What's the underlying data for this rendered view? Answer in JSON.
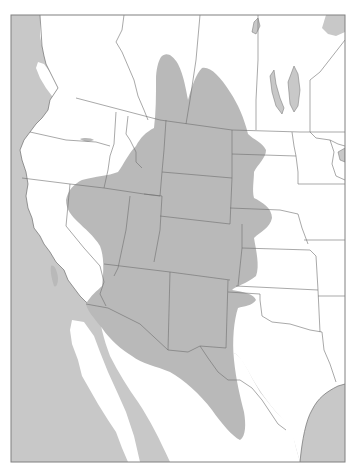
{
  "map": {
    "type": "species-range-map",
    "region": "Western North America",
    "frame": {
      "x": 11,
      "y": 15,
      "width": 334,
      "height": 447
    },
    "colors": {
      "water": "#c8c8c8",
      "land": "#ffffff",
      "range": "#b9b9b9",
      "border": "#6e6e6e",
      "frame": "#808080"
    },
    "legend": [],
    "labels": [],
    "range_description": "Gray shaded distribution covering the Great Plains west edge, Rocky Mountain states, Great Basin, Arizona, New Mexico, west Texas, and into northern Mexico; extends north into southern Alberta/Saskatchewan; small disjunct patches in central California and eastern Oregon."
  }
}
